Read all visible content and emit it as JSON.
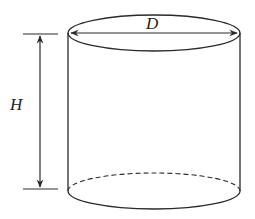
{
  "diagram": {
    "labels": {
      "diameter": "D",
      "height": "H"
    },
    "colors": {
      "stroke": "#2a2a2a",
      "background": "#ffffff"
    }
  }
}
